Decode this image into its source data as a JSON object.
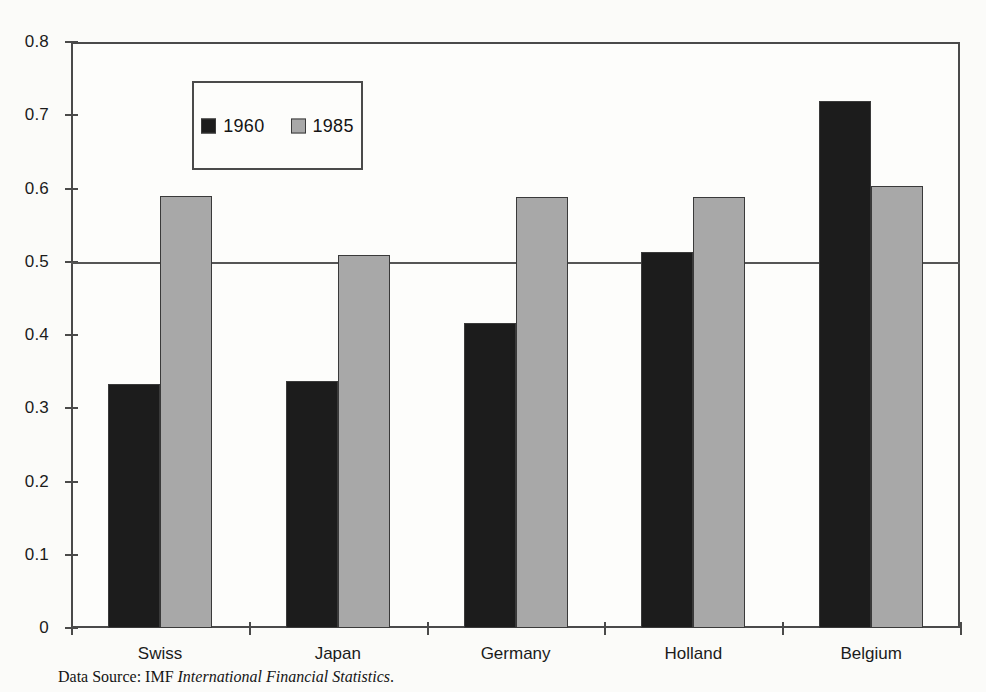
{
  "chart_data": {
    "type": "bar",
    "title": "",
    "subtitle": "",
    "xlabel": "",
    "ylabel": "",
    "categories": [
      "Swiss",
      "Japan",
      "Germany",
      "Holland",
      "Belgium"
    ],
    "series": [
      {
        "name": "1960",
        "color": "#1c1c1c",
        "values": [
          0.333,
          0.337,
          0.416,
          0.514,
          0.719
        ]
      },
      {
        "name": "1985",
        "color": "#a8a8a8",
        "values": [
          0.59,
          0.509,
          0.589,
          0.589,
          0.604
        ]
      }
    ],
    "ylim": [
      0,
      0.8
    ],
    "ytick_values": [
      0,
      0.1,
      0.2,
      0.3,
      0.4,
      0.5,
      0.6,
      0.7,
      0.8
    ],
    "ytick_labels": [
      "0",
      "0.1",
      "0.2",
      "0.3",
      "0.4",
      "0.5",
      "0.6",
      "0.7",
      "0.8"
    ],
    "gridlines": [
      0.5
    ],
    "grid": false,
    "legend_position": "upper-left-inside",
    "annotations": []
  },
  "legend": {
    "entries": [
      {
        "label": "1960",
        "swatch": "dark-square-swatch"
      },
      {
        "label": "1985",
        "swatch": "gray-square-swatch"
      }
    ]
  },
  "caption": {
    "prefix": "Data Source: IMF ",
    "italic_title": "International Financial Statistics",
    "suffix": "."
  },
  "colors": {
    "series_1960": "#1c1c1c",
    "series_1985": "#a8a8a8",
    "axis": "#4a4a4a",
    "text": "#1b1b1b",
    "background": "#fbfbf9"
  }
}
